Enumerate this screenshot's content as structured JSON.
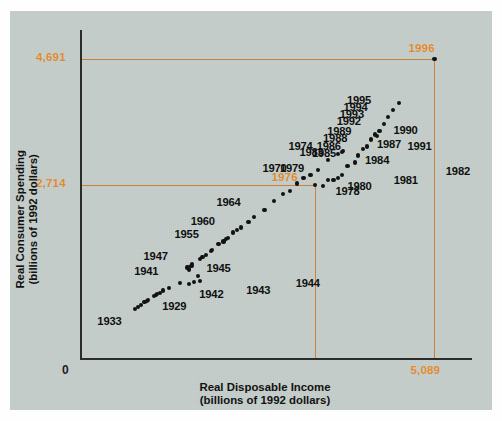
{
  "chart_data": {
    "type": "scatter",
    "title": "",
    "xlabel": "Real Disposable Income (billions of 1992 dollars)",
    "ylabel": "Real Consumer Spending (billions of 1992 dollars)",
    "xlabel_line1": "Real Disposable Income",
    "xlabel_line2": "(billions of 1992 dollars)",
    "ylabel_line1": "Real Consumer Spending",
    "ylabel_line2": "(billions of 1992 dollars)",
    "grid": false,
    "legend": "none",
    "x_ticks": [
      "0",
      "5,089"
    ],
    "y_ticks": [
      "0",
      "2,714",
      "4,691"
    ],
    "origin_label": "0",
    "x_max_label": "5,089",
    "y_ref_labels": [
      "2,714",
      "4,691"
    ],
    "highlight_labels": [
      "1976",
      "1996"
    ],
    "accent_color": "#e08a2e",
    "reference_line_color": "#c8833c",
    "point_color": "#121212",
    "panel_color": "#c3ccc8",
    "xlim": [
      0,
      5600
    ],
    "ylim": [
      0,
      5150
    ],
    "reference_lines": {
      "horizontal": [
        2714,
        4691
      ],
      "vertical_x_values": [
        3380,
        5089
      ],
      "vertical_labels": [
        "1976",
        "5,089"
      ]
    },
    "points": [
      {
        "year": "1929",
        "x": 1065,
        "y": 975,
        "label": "1929",
        "label_dx": 8,
        "label_dy": 10
      },
      {
        "year": "1930",
        "x": 980,
        "y": 915,
        "label": ""
      },
      {
        "year": "1931",
        "x": 925,
        "y": 875,
        "label": ""
      },
      {
        "year": "1932",
        "x": 830,
        "y": 800,
        "label": ""
      },
      {
        "year": "1933",
        "x": 795,
        "y": 775,
        "label": "1933",
        "label_dx": -38,
        "label_dy": 12
      },
      {
        "year": "1934",
        "x": 880,
        "y": 830,
        "label": ""
      },
      {
        "year": "1935",
        "x": 965,
        "y": 890,
        "label": ""
      },
      {
        "year": "1936",
        "x": 1090,
        "y": 985,
        "label": ""
      },
      {
        "year": "1937",
        "x": 1150,
        "y": 1020,
        "label": ""
      },
      {
        "year": "1938",
        "x": 1105,
        "y": 1000,
        "label": ""
      },
      {
        "year": "1939",
        "x": 1190,
        "y": 1060,
        "label": ""
      },
      {
        "year": "1940",
        "x": 1275,
        "y": 1105,
        "label": ""
      },
      {
        "year": "1941",
        "x": 1440,
        "y": 1180,
        "label": "1941",
        "label_dx": -46,
        "label_dy": -12
      },
      {
        "year": "1942",
        "x": 1570,
        "y": 1160,
        "label": "1942",
        "label_dx": 10,
        "label_dy": 10
      },
      {
        "year": "1943",
        "x": 1640,
        "y": 1190,
        "label": "1943",
        "label_dx": 52,
        "label_dy": 8
      },
      {
        "year": "1944",
        "x": 1720,
        "y": 1215,
        "label": "1944",
        "label_dx": 96,
        "label_dy": 2
      },
      {
        "year": "1945",
        "x": 1700,
        "y": 1290,
        "label": "1945",
        "label_dx": 8,
        "label_dy": -8
      },
      {
        "year": "1946",
        "x": 1560,
        "y": 1390,
        "label": ""
      },
      {
        "year": "1947",
        "x": 1545,
        "y": 1420,
        "label": "1947",
        "label_dx": -44,
        "label_dy": -12
      },
      {
        "year": "1948",
        "x": 1600,
        "y": 1450,
        "label": ""
      },
      {
        "year": "1949",
        "x": 1610,
        "y": 1480,
        "label": ""
      },
      {
        "year": "1950",
        "x": 1720,
        "y": 1560,
        "label": ""
      },
      {
        "year": "1951",
        "x": 1760,
        "y": 1580,
        "label": ""
      },
      {
        "year": "1952",
        "x": 1810,
        "y": 1620,
        "label": ""
      },
      {
        "year": "1953",
        "x": 1880,
        "y": 1680,
        "label": ""
      },
      {
        "year": "1954",
        "x": 1900,
        "y": 1700,
        "label": ""
      },
      {
        "year": "1955",
        "x": 1990,
        "y": 1790,
        "label": "1955",
        "label_dx": -44,
        "label_dy": -10
      },
      {
        "year": "1956",
        "x": 2060,
        "y": 1830,
        "label": ""
      },
      {
        "year": "1957",
        "x": 2100,
        "y": 1870,
        "label": ""
      },
      {
        "year": "1958",
        "x": 2120,
        "y": 1890,
        "label": ""
      },
      {
        "year": "1959",
        "x": 2200,
        "y": 1970,
        "label": ""
      },
      {
        "year": "1960",
        "x": 2250,
        "y": 2010,
        "label": "1960",
        "label_dx": -46,
        "label_dy": -9
      },
      {
        "year": "1961",
        "x": 2310,
        "y": 2050,
        "label": ""
      },
      {
        "year": "1962",
        "x": 2420,
        "y": 2140,
        "label": ""
      },
      {
        "year": "1963",
        "x": 2500,
        "y": 2210,
        "label": ""
      },
      {
        "year": "1964",
        "x": 2650,
        "y": 2330,
        "label": "1964",
        "label_dx": -48,
        "label_dy": -8
      },
      {
        "year": "1965",
        "x": 2790,
        "y": 2460,
        "label": ""
      },
      {
        "year": "1966",
        "x": 2910,
        "y": 2570,
        "label": ""
      },
      {
        "year": "1967",
        "x": 3010,
        "y": 2620,
        "label": ""
      },
      {
        "year": "1968",
        "x": 3120,
        "y": 2740,
        "label": ""
      },
      {
        "year": "1969",
        "x": 3210,
        "y": 2820,
        "label": ""
      },
      {
        "year": "1970",
        "x": 3310,
        "y": 2870,
        "label": "1970",
        "label_dx": -48,
        "label_dy": -7
      },
      {
        "year": "1971",
        "x": 3420,
        "y": 2950,
        "label": ""
      },
      {
        "year": "1972",
        "x": 3560,
        "y": 3110,
        "label": ""
      },
      {
        "year": "1973",
        "x": 3760,
        "y": 3230,
        "label": ""
      },
      {
        "year": "1974",
        "x": 3710,
        "y": 3200,
        "label": "1974",
        "label_dx": -50,
        "label_dy": -8
      },
      {
        "year": "1975",
        "x": 3780,
        "y": 3250,
        "label": ""
      },
      {
        "year": "1976",
        "x": 3380,
        "y": 2714,
        "label": "",
        "is_corner": true
      },
      {
        "year": "1978",
        "x": 3495,
        "y": 2705,
        "label": "1978",
        "label_dx": 12,
        "label_dy": 5
      },
      {
        "year": "1979",
        "x": 3560,
        "y": 2790,
        "label": "1979",
        "label_dx": -48,
        "label_dy": -12
      },
      {
        "year": "1980",
        "x": 3640,
        "y": 2800,
        "label": "1980",
        "label_dx": 14,
        "label_dy": 6
      },
      {
        "year": "1981",
        "x": 3700,
        "y": 2830,
        "label": "1981",
        "label_dx": 56,
        "label_dy": 2
      },
      {
        "year": "1982",
        "x": 3760,
        "y": 2870,
        "label": "1982",
        "label_dx": 104,
        "label_dy": -4
      },
      {
        "year": "1983",
        "x": 3840,
        "y": 3010,
        "label": "1983",
        "label_dx": -48,
        "label_dy": -14
      },
      {
        "year": "1984",
        "x": 3950,
        "y": 3070,
        "label": "1984",
        "label_dx": 10,
        "label_dy": -2
      },
      {
        "year": "1985",
        "x": 3990,
        "y": 3180,
        "label": "1985",
        "label_dx": -46,
        "label_dy": -2
      },
      {
        "year": "1986",
        "x": 4060,
        "y": 3280,
        "label": "1986",
        "label_dx": -46,
        "label_dy": -3
      },
      {
        "year": "1987",
        "x": 4120,
        "y": 3320,
        "label": "1987",
        "label_dx": 10,
        "label_dy": -3
      },
      {
        "year": "1988",
        "x": 4180,
        "y": 3430,
        "label": "1988",
        "label_dx": -48,
        "label_dy": -2
      },
      {
        "year": "1989",
        "x": 4240,
        "y": 3510,
        "label": "1989",
        "label_dx": -48,
        "label_dy": -3
      },
      {
        "year": "1990",
        "x": 4300,
        "y": 3560,
        "label": "1990",
        "label_dx": 14,
        "label_dy": -1
      },
      {
        "year": "1991",
        "x": 4270,
        "y": 3480,
        "label": "1991",
        "label_dx": 30,
        "label_dy": 10
      },
      {
        "year": "1992",
        "x": 4360,
        "y": 3670,
        "label": "1992",
        "label_dx": -47,
        "label_dy": -3
      },
      {
        "year": "1993",
        "x": 4420,
        "y": 3790,
        "label": "1993",
        "label_dx": -48,
        "label_dy": -3
      },
      {
        "year": "1994",
        "x": 4500,
        "y": 3900,
        "label": "1994",
        "label_dx": -50,
        "label_dy": -3
      },
      {
        "year": "1995",
        "x": 4580,
        "y": 4010,
        "label": "1995",
        "label_dx": -52,
        "label_dy": -3
      },
      {
        "year": "1996",
        "x": 5089,
        "y": 4691,
        "label": "",
        "is_corner": true
      }
    ]
  },
  "axis": {
    "origin_label": "0",
    "x_max_label": "5,089",
    "y_mid_label": "2,714",
    "y_top_label": "4,691",
    "corner_label_1976": "1976",
    "corner_label_1996": "1996"
  }
}
